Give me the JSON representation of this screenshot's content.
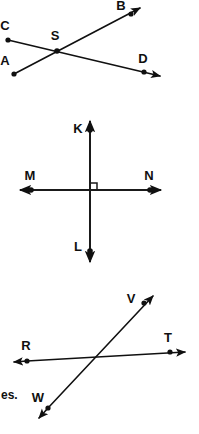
{
  "page": {
    "width": 199,
    "height": 434,
    "background_color": "#ffffff",
    "ink_color": "#101010"
  },
  "text_fragment": {
    "value": "es.",
    "x": 2,
    "y": 396
  },
  "figures": [
    {
      "id": "figure-intersecting-rays-top",
      "name": "intersecting-rays-CB-AD",
      "kind": "two-intersecting-lines",
      "intersection_label": "S",
      "points": [
        {
          "label": "C",
          "x": 8,
          "y": 40,
          "label_x": 5,
          "label_y": 27,
          "has_dot": true,
          "clipped": true
        },
        {
          "label": "A",
          "x": 14,
          "y": 74,
          "label_x": 5,
          "label_y": 62,
          "has_dot": true,
          "clipped": true
        },
        {
          "label": "S",
          "x": 57,
          "y": 51,
          "label_x": 55,
          "label_y": 37,
          "has_dot": true,
          "clipped": false
        },
        {
          "label": "B",
          "x": 131,
          "y": 14,
          "label_x": 121,
          "label_y": 6,
          "has_dot": true,
          "clipped": false
        },
        {
          "label": "D",
          "x": 144,
          "y": 72,
          "label_x": 143,
          "label_y": 60,
          "has_dot": true,
          "clipped": false
        }
      ],
      "segments": [
        {
          "name": "ray-A-to-B",
          "from_x": 14,
          "to_x": 143,
          "from_y": 74,
          "to_y": 6,
          "arrow_end": true
        },
        {
          "name": "ray-C-to-D",
          "from_x": 8,
          "to_x": 163,
          "from_y": 40,
          "to_y": 77,
          "arrow_end": true
        }
      ]
    },
    {
      "id": "figure-perpendicular-lines-middle",
      "name": "perpendicular-lines-KL-MN",
      "kind": "perpendicular-lines",
      "right_angle_marker": true,
      "points": [
        {
          "label": "K",
          "x": 90,
          "y": 130,
          "label_x": 78,
          "label_y": 130,
          "has_dot": true,
          "clipped": false
        },
        {
          "label": "M",
          "x": 31,
          "y": 190,
          "label_x": 30,
          "label_y": 177,
          "has_dot": true,
          "clipped": false
        },
        {
          "label": "N",
          "x": 150,
          "y": 190,
          "label_x": 149,
          "label_y": 177,
          "has_dot": true,
          "clipped": false
        },
        {
          "label": "L",
          "x": 90,
          "y": 251,
          "label_x": 78,
          "label_y": 248,
          "has_dot": true,
          "clipped": false
        }
      ],
      "segments": [
        {
          "name": "line-K-to-L-vertical",
          "from_x": 90,
          "to_x": 90,
          "from_y": 119,
          "to_y": 265,
          "arrow_both": true
        },
        {
          "name": "line-M-to-N-horizontal",
          "from_x": 18,
          "to_x": 162,
          "from_y": 190,
          "to_y": 190,
          "arrow_both": true
        }
      ]
    },
    {
      "id": "figure-intersecting-rays-bottom",
      "name": "intersecting-lines-RT-VW",
      "kind": "two-intersecting-lines",
      "points": [
        {
          "label": "V",
          "x": 144,
          "y": 303,
          "label_x": 131,
          "label_y": 300,
          "has_dot": true,
          "clipped": false
        },
        {
          "label": "R",
          "x": 27,
          "y": 360,
          "label_x": 26,
          "label_y": 347,
          "has_dot": true,
          "clipped": false
        },
        {
          "label": "T",
          "x": 170,
          "y": 352,
          "label_x": 168,
          "label_y": 339,
          "has_dot": true,
          "clipped": false
        },
        {
          "label": "W",
          "x": 48,
          "y": 408,
          "label_x": 38,
          "label_y": 399,
          "has_dot": true,
          "clipped": false
        }
      ],
      "segments": [
        {
          "name": "line-R-to-T-horizontal",
          "from_x": 11,
          "to_x": 188,
          "from_y": 364,
          "to_y": 352,
          "arrow_both": true
        },
        {
          "name": "line-W-to-V-diagonal",
          "from_x": 36,
          "to_x": 156,
          "from_y": 422,
          "to_y": 293,
          "arrow_both": true
        }
      ]
    }
  ]
}
